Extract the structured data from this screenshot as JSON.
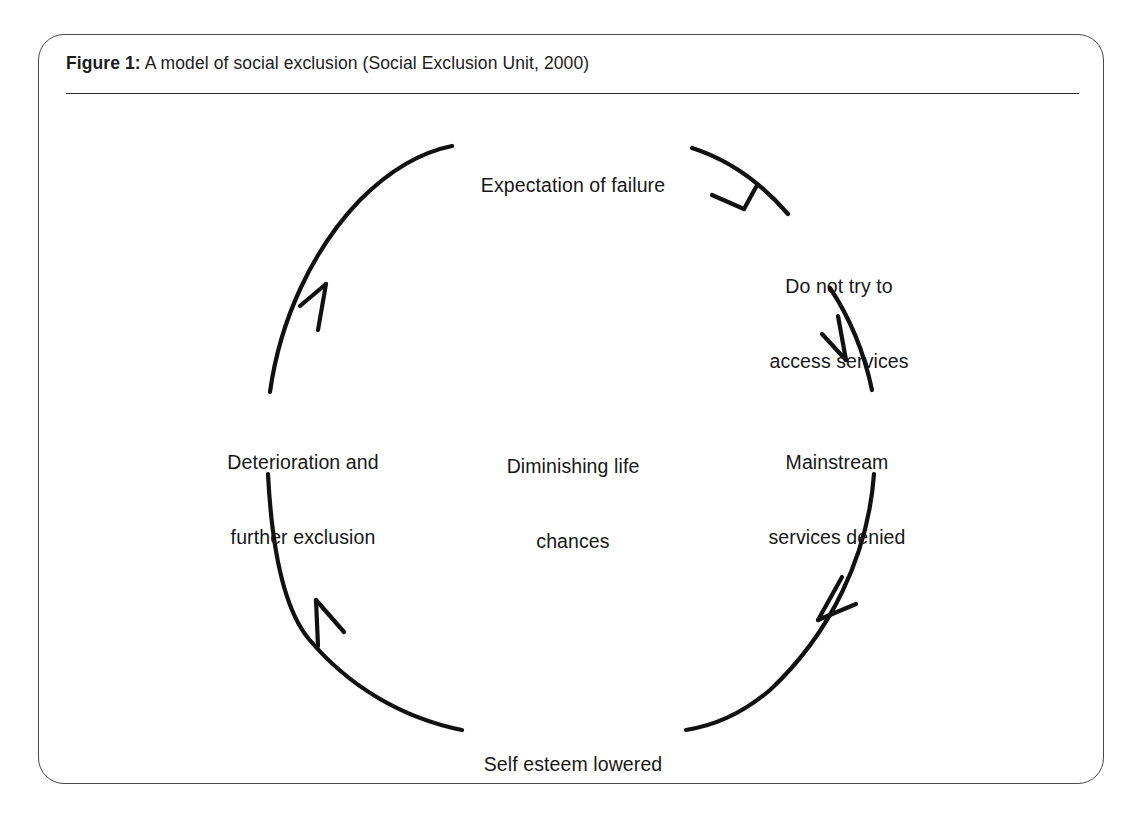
{
  "figure": {
    "number_label": "Figure 1:",
    "caption_text": " A model of social exclusion (Social Exclusion Unit, 2000)",
    "full_caption": "Figure 1: A model of social exclusion (Social Exclusion Unit, 2000)"
  },
  "diagram": {
    "type": "cycle",
    "title": "A model of social exclusion",
    "center_label": {
      "line1": "Diminishing life",
      "line2": "chances"
    },
    "nodes": [
      {
        "id": "expectation-of-failure",
        "position": "top",
        "line1": "Expectation of failure",
        "line2": ""
      },
      {
        "id": "do-not-try-to-access-services",
        "position": "top-right",
        "line1": "Do not try to",
        "line2": "access services"
      },
      {
        "id": "mainstream-services-denied",
        "position": "right",
        "line1": "Mainstream",
        "line2": "services denied"
      },
      {
        "id": "self-esteem-lowered",
        "position": "bottom",
        "line1": "Self esteem lowered",
        "line2": ""
      },
      {
        "id": "deterioration-and-further-exclusion",
        "position": "left",
        "line1": "Deterioration and",
        "line2": "further exclusion"
      }
    ],
    "flow_direction": "clockwise",
    "arrow_count": 4,
    "colors": {
      "stroke": "#111111",
      "frame": "#4a4a4a",
      "rule": "#2b2b2b",
      "text": "#171717",
      "background": "#ffffff"
    }
  }
}
